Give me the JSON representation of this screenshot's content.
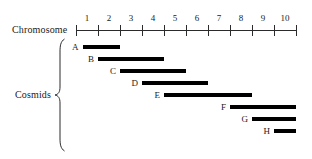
{
  "figure": {
    "axis": {
      "label": "Chromosome",
      "tick_numbers": [
        "1",
        "2",
        "3",
        "4",
        "5",
        "6",
        "7",
        "8",
        "9",
        "10"
      ],
      "tick_count": 11,
      "range": [
        0,
        10
      ],
      "pixel_start": 76,
      "pixel_end": 296,
      "color": "#2b2b2b"
    },
    "group": {
      "label": "Cosmids",
      "brace": "left-curly-brace"
    },
    "bar_color": "#000000"
  },
  "chart_data": {
    "type": "bar",
    "title": "",
    "subtitle": "",
    "xlabel": "Chromosome",
    "ylabel": "Cosmids",
    "xlim": [
      0,
      10
    ],
    "grid": false,
    "legend": "none",
    "orientation": "horizontal-range-bars",
    "categories": [
      "A",
      "B",
      "C",
      "D",
      "E",
      "F",
      "G",
      "H"
    ],
    "bars": [
      {
        "name": "A",
        "start": 0.3,
        "end": 2.0,
        "top_px": 41
      },
      {
        "name": "B",
        "start": 1.0,
        "end": 4.0,
        "top_px": 53
      },
      {
        "name": "C",
        "start": 2.0,
        "end": 5.0,
        "top_px": 65
      },
      {
        "name": "D",
        "start": 3.0,
        "end": 6.0,
        "top_px": 77
      },
      {
        "name": "E",
        "start": 4.0,
        "end": 8.0,
        "top_px": 89
      },
      {
        "name": "F",
        "start": 7.0,
        "end": 10.0,
        "top_px": 101
      },
      {
        "name": "G",
        "start": 8.0,
        "end": 10.0,
        "top_px": 113
      },
      {
        "name": "H",
        "start": 9.0,
        "end": 10.0,
        "top_px": 125
      }
    ]
  }
}
